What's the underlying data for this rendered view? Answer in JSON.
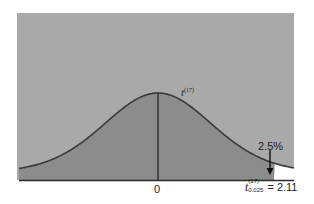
{
  "chart_data": {
    "type": "area",
    "title": "",
    "distribution": "Student t",
    "degrees_of_freedom": 17,
    "curve_label": "t",
    "curve_label_superscript": "(17)",
    "xlabel": "",
    "ylabel": "",
    "tick_labels": [
      "0"
    ],
    "x_ticks": [
      0
    ],
    "critical_value": {
      "symbol": "t",
      "superscript": "(17)",
      "subscript": "0.025",
      "equals": "= 2.11",
      "value": 2.11
    },
    "tail_area_label": "2.5%",
    "tail_area_fraction": 0.025,
    "shaded_region": "x < 2.11",
    "unshaded_tail": "x > 2.11",
    "xlim": [
      -3.5,
      3.5
    ],
    "grid": false,
    "legend": "none",
    "colors": {
      "background_panel": "#a9a9a9",
      "area_under_curve": "#8c8c8c",
      "tail_area": "#ffffff",
      "curve": "#3a3a3a",
      "axis": "#2a2a2a"
    }
  },
  "labels": {
    "zero": "0",
    "pct": "2.5%",
    "curve_t": "t",
    "curve_sup": "(17)",
    "crit_t": "t",
    "crit_sup": "(17)",
    "crit_sub": "0.025",
    "crit_eq": "= 2.11"
  }
}
